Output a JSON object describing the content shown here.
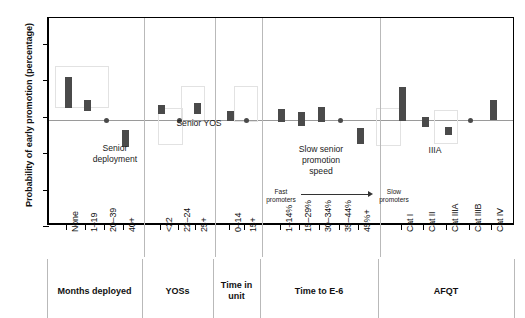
{
  "chart_data": {
    "type": "bar",
    "title": "",
    "xlabel": "",
    "ylabel": "Probability of early promotion (percentage)",
    "ylim": [
      10,
      38.5
    ],
    "yticks": [
      10,
      15,
      20,
      25,
      30,
      35
    ],
    "grid": false,
    "reference_line": 24.5,
    "value_note": "Bars show confidence-interval ranges (low–high); dots mark reference categories held at the baseline value.",
    "groups": [
      {
        "name": "Months deployed",
        "categories": [
          "None",
          "1–19",
          "20–39",
          "40+"
        ],
        "low": [
          26.2,
          25.7,
          24.5,
          20.8
        ],
        "high": [
          30.4,
          27.3,
          24.5,
          23.2
        ],
        "kinds": [
          "bar",
          "bar",
          "dot",
          "bar"
        ]
      },
      {
        "name": "YOSs",
        "categories": [
          "<22",
          "22–24",
          "25+"
        ],
        "low": [
          25.4,
          24.5,
          25.4
        ],
        "high": [
          26.6,
          24.5,
          26.8
        ],
        "kinds": [
          "bar",
          "dot",
          "bar"
        ]
      },
      {
        "name": "Time in unit",
        "categories": [
          "0–14",
          "15+"
        ],
        "low": [
          24.4,
          24.5
        ],
        "high": [
          25.7,
          24.5
        ],
        "kinds": [
          "bar",
          "dot"
        ]
      },
      {
        "name": "Time to E-6",
        "categories": [
          "1–14%",
          "15–29%",
          "30–34%",
          "35–44%",
          "45%+"
        ],
        "low": [
          24.2,
          23.7,
          24.3,
          24.5,
          21.2
        ],
        "high": [
          26.0,
          25.6,
          26.3,
          24.5,
          23.4
        ],
        "kinds": [
          "bar",
          "bar",
          "bar",
          "dot",
          "bar"
        ]
      },
      {
        "name": "AFQT",
        "categories": [
          "Cat I",
          "Cat II",
          "Cat IIIA",
          "Cat IIIB",
          "Cat IV"
        ],
        "low": [
          24.4,
          23.6,
          22.4,
          24.5,
          24.5
        ],
        "high": [
          29.0,
          24.9,
          23.5,
          24.5,
          27.2
        ],
        "kinds": [
          "bar",
          "bar",
          "bar",
          "dot",
          "bar"
        ]
      }
    ],
    "annotations": [
      {
        "id": "senior-deployment",
        "text": "Senior\ndeployment"
      },
      {
        "id": "senior-yos",
        "text": "Senior YOS"
      },
      {
        "id": "slow-senior-promotion-speed",
        "text": "Slow senior\npromotion\nspeed"
      },
      {
        "id": "iiia",
        "text": "IIIA"
      },
      {
        "id": "fast-promoters",
        "text": "Fast\npromoters"
      },
      {
        "id": "slow-promoters",
        "text": "Slow\npromoters"
      }
    ],
    "colors": {
      "bar": "#4a4a4a",
      "reference_line": "#9a9a9a",
      "group_divider": "#b9b9b9",
      "axis": "#000000",
      "highlight_box": "#e2e2e2",
      "background": "#ffffff"
    }
  },
  "axis": {
    "y_title": "Probability of early promotion (percentage)",
    "y_tick_labels": [
      "35",
      "30",
      "25",
      "20",
      "15",
      "10"
    ]
  },
  "group_labels": {
    "months_deployed": "Months deployed",
    "yoss": "YOSs",
    "time_in_unit": "Time in\nunit",
    "time_to_e6": "Time to E-6",
    "afqt": "AFQT"
  },
  "x_labels": [
    "None",
    "1–19",
    "20–39",
    "40+",
    "<22",
    "22–24",
    "25+",
    "0–14",
    "15+",
    "1–14%",
    "15–29%",
    "30–34%",
    "35–44%",
    "45%+",
    "Cat I",
    "Cat II",
    "Cat IIIA",
    "Cat IIIB",
    "Cat IV"
  ],
  "annotations": {
    "senior_deployment": "Senior\ndeployment",
    "senior_yos": "Senior YOS",
    "slow_senior_promotion_speed": "Slow senior\npromotion\nspeed",
    "iiia": "IIIA",
    "fast_promoters": "Fast\npromoters",
    "slow_promoters": "Slow\npromoters"
  }
}
